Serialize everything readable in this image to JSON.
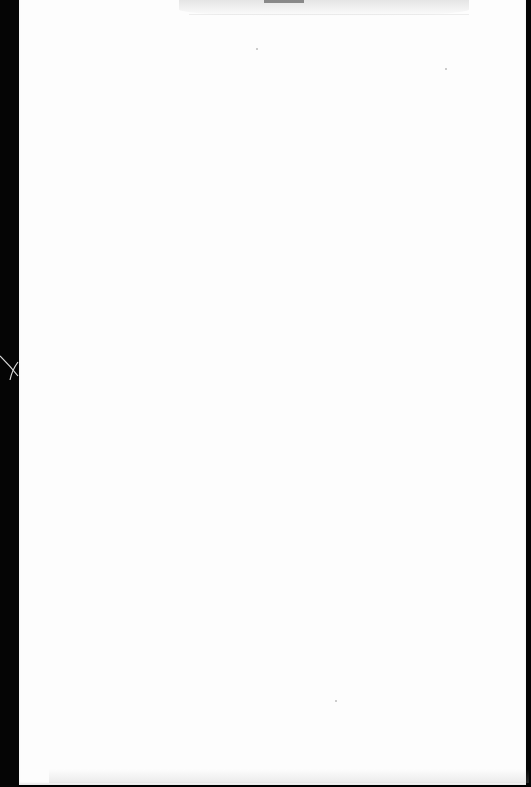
{
  "document": {
    "type": "scanned-page",
    "content": "",
    "page_color": "#fdfdfd",
    "border_color": "#050505",
    "marks": [
      "top-bleed-through-smudge",
      "left-edge-cross-mark",
      "bottom-edge-smudge"
    ]
  }
}
